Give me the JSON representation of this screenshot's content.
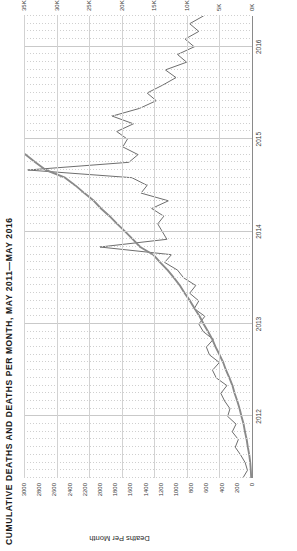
{
  "chart": {
    "title": "CUMULATIVE DEATHS AND DEATHS PER MONTH, MAY 2011—MAY 2016",
    "rotation": "page rotated 90 degrees counter-clockwise",
    "y_left_title": "Deaths Per Month",
    "y_left_ticks": [
      "3000",
      "2800",
      "2600",
      "2400",
      "2200",
      "2000",
      "1800",
      "1600",
      "1400",
      "1200",
      "1000",
      "800",
      "600",
      "400",
      "200",
      "0"
    ],
    "y_right_ticks": [
      "35K",
      "30K",
      "25K",
      "20K",
      "15K",
      "10K",
      "5K",
      "0K"
    ],
    "x_ticks": [
      "2012",
      "2013",
      "2014",
      "2015",
      "2016"
    ]
  },
  "chart_data": {
    "type": "line",
    "title": "CUMULATIVE DEATHS AND DEATHS PER MONTH, MAY 2011—MAY 2016",
    "xlabel": "",
    "ylabel": "Deaths Per Month",
    "y2label": "",
    "ylim": [
      0,
      3000
    ],
    "y2lim": [
      0,
      35000
    ],
    "grid": true,
    "legend": "none",
    "x_tick_labels": [
      "2012",
      "2013",
      "2014",
      "2015",
      "2016"
    ],
    "y_tick_labels": [
      "0",
      "200",
      "400",
      "600",
      "800",
      "1000",
      "1200",
      "1400",
      "1600",
      "1800",
      "2000",
      "2200",
      "2400",
      "2600",
      "2800",
      "3000"
    ],
    "y2_tick_labels": [
      "0K",
      "5K",
      "10K",
      "15K",
      "20K",
      "25K",
      "30K",
      "35K"
    ],
    "x": [
      "2011-05",
      "2011-06",
      "2011-07",
      "2011-08",
      "2011-09",
      "2011-10",
      "2011-11",
      "2011-12",
      "2012-01",
      "2012-02",
      "2012-03",
      "2012-04",
      "2012-05",
      "2012-06",
      "2012-07",
      "2012-08",
      "2012-09",
      "2012-10",
      "2012-11",
      "2012-12",
      "2013-01",
      "2013-02",
      "2013-03",
      "2013-04",
      "2013-05",
      "2013-06",
      "2013-07",
      "2013-08",
      "2013-09",
      "2013-10",
      "2013-11",
      "2013-12",
      "2014-01",
      "2014-02",
      "2014-03",
      "2014-04",
      "2014-05",
      "2014-06",
      "2014-07",
      "2014-08",
      "2014-09",
      "2014-10",
      "2014-11",
      "2014-12",
      "2015-01",
      "2015-02",
      "2015-03",
      "2015-04",
      "2015-05",
      "2015-06",
      "2015-07",
      "2015-08",
      "2015-09",
      "2015-10",
      "2015-11",
      "2015-12",
      "2016-01",
      "2016-02",
      "2016-03",
      "2016-04",
      "2016-05"
    ],
    "series": [
      {
        "name": "Deaths Per Month",
        "axis": "left",
        "color": "#6e6e6e",
        "values": [
          120,
          60,
          90,
          150,
          220,
          180,
          260,
          210,
          320,
          290,
          360,
          410,
          330,
          470,
          520,
          430,
          560,
          600,
          510,
          640,
          700,
          620,
          760,
          700,
          820,
          740,
          900,
          980,
          1150,
          1060,
          2000,
          1120,
          1180,
          1240,
          1160,
          1320,
          1100,
          1460,
          1380,
          1580,
          2950,
          1620,
          1500,
          1700,
          1640,
          1780,
          1560,
          1840,
          1480,
          1260,
          1380,
          1180,
          1000,
          1140,
          860,
          980,
          760,
          880,
          700,
          820,
          640
        ]
      },
      {
        "name": "Cumulative Deaths",
        "axis": "right",
        "color": "#8a8a8a",
        "values": [
          120,
          180,
          270,
          420,
          640,
          820,
          1080,
          1290,
          1610,
          1900,
          2260,
          2670,
          3000,
          3470,
          3990,
          4420,
          4980,
          5580,
          6090,
          6730,
          7430,
          8050,
          8810,
          9510,
          10330,
          11070,
          11970,
          12950,
          14100,
          15160,
          17160,
          18280,
          19460,
          20700,
          21860,
          23180,
          24280,
          25740,
          27120,
          28700,
          31650,
          33270,
          34770,
          36470,
          38110,
          39890,
          41450,
          43290,
          44770,
          46030,
          47410,
          48590,
          49590,
          50730,
          51590,
          52570,
          53330,
          54210,
          54910,
          55730,
          56370
        ]
      }
    ]
  }
}
